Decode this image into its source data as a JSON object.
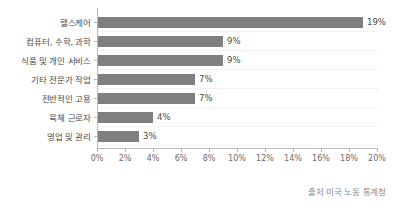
{
  "chart_data": {
    "type": "bar",
    "orientation": "horizontal",
    "title": "",
    "xlabel": "",
    "ylabel": "",
    "xlim": [
      0,
      20
    ],
    "grid": false,
    "legend": false,
    "categories": [
      "헬스케어",
      "컴퓨터, 수학, 과학",
      "식품 및 개인 서비스",
      "기타 전문가 작업",
      "전반적인 고용",
      "육체 근로자",
      "영업 및 관리"
    ],
    "values": [
      19,
      9,
      9,
      7,
      7,
      4,
      3
    ],
    "value_labels": [
      "19%",
      "9%",
      "9%",
      "7%",
      "7%",
      "4%",
      "3%"
    ],
    "xticks": [
      0,
      2,
      4,
      6,
      8,
      10,
      12,
      14,
      16,
      18,
      20
    ],
    "xtick_labels": [
      "0%",
      "2%",
      "4%",
      "6%",
      "8%",
      "10%",
      "12%",
      "14%",
      "16%",
      "18%",
      "20%"
    ],
    "bar_color": "#7f7f7f",
    "axis_color": "#b8b8b8",
    "background_color": "#ffffff"
  },
  "source": {
    "text": "출처 미국 노동 통계청"
  }
}
